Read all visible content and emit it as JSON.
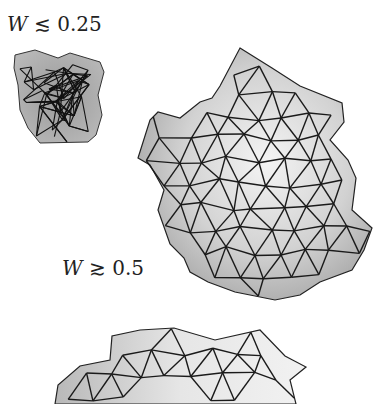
{
  "figure": {
    "panels": [
      {
        "id": "crumpled",
        "label": {
          "variable": "W",
          "relation": "≲",
          "value": "0.25"
        },
        "description": "small crumpled triangulated surface"
      },
      {
        "id": "smooth",
        "label": {
          "variable": "W",
          "relation": "≳",
          "value": "0.5"
        },
        "description": "smooth triangulated surface"
      },
      {
        "id": "bottom",
        "description": "partially visible triangulated surface (cropped)"
      }
    ],
    "colors": {
      "background": "#ffffff",
      "edge": "#1a1a1a",
      "face_light": "#e8e8e8",
      "face_mid": "#c4c4c4",
      "face_dark": "#9a9a9a"
    }
  }
}
